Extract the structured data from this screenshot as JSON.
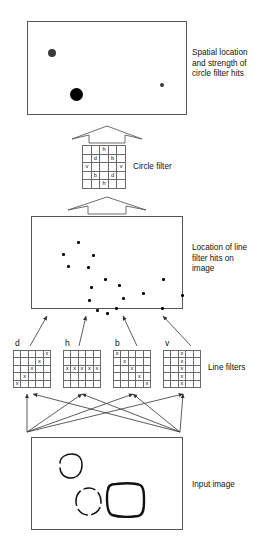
{
  "figure": {
    "stroke_color": "#555555",
    "accent_color": "#000000"
  },
  "panels": {
    "circle_hits": {
      "caption": "Spatial location\nand strength of\ncircle filter hits",
      "dots": [
        {
          "name": "medium-hit-dot",
          "x": 24,
          "y": 31,
          "r": 4.0,
          "shade": "#3a3a3a"
        },
        {
          "name": "strong-hit-dot",
          "x": 48,
          "y": 72,
          "r": 6.5,
          "shade": "#000000"
        },
        {
          "name": "weak-hit-dot",
          "x": 134,
          "y": 63,
          "r": 2.0,
          "shade": "#3a3a3a"
        }
      ]
    },
    "line_hits": {
      "caption": "Location of line\nfilter hits on\nimage",
      "clusters": [
        {
          "name": "cluster-small-circle",
          "dots": [
            {
              "x": 23,
              "y": 6
            },
            {
              "x": 8,
              "y": 18
            },
            {
              "x": 38,
              "y": 19
            },
            {
              "x": 13,
              "y": 30
            },
            {
              "x": 33,
              "y": 31
            }
          ]
        },
        {
          "name": "cluster-dashed-circle",
          "dots": [
            {
              "x": 22,
              "y": 3
            },
            {
              "x": 36,
              "y": 9
            },
            {
              "x": 8,
              "y": 11
            },
            {
              "x": 40,
              "y": 22
            },
            {
              "x": 6,
              "y": 24
            },
            {
              "x": 33,
              "y": 32
            },
            {
              "x": 14,
              "y": 34
            },
            {
              "x": 24,
              "y": 37
            }
          ]
        },
        {
          "name": "cluster-square",
          "dots": [
            {
              "x": 25,
              "y": 4
            },
            {
              "x": 5,
              "y": 18
            },
            {
              "x": 44,
              "y": 20
            },
            {
              "x": 24,
              "y": 33
            }
          ]
        }
      ]
    },
    "input_image": {
      "caption": "Input image",
      "shapes": [
        {
          "name": "small-circle-shape",
          "kind": "circle-solid"
        },
        {
          "name": "dashed-circle-shape",
          "kind": "circle-dashed"
        },
        {
          "name": "rounded-square-shape",
          "kind": "rounded-square"
        }
      ]
    }
  },
  "circle_filter": {
    "label": "Circle filter",
    "rows": 5,
    "cols": 5,
    "cells": [
      [
        "",
        "",
        "h",
        "",
        ""
      ],
      [
        "",
        "d",
        "",
        "b",
        ""
      ],
      [
        "v",
        "",
        "",
        "",
        "v"
      ],
      [
        "",
        "b",
        "",
        "d",
        ""
      ],
      [
        "",
        "",
        "h",
        "",
        ""
      ]
    ]
  },
  "line_filters": {
    "label": "Line filters",
    "mark": "x",
    "filters": [
      {
        "name": "d",
        "label": "d",
        "cells": [
          [
            "",
            "",
            "",
            "",
            "x"
          ],
          [
            "",
            "",
            "",
            "x",
            ""
          ],
          [
            "",
            "",
            "x",
            "",
            ""
          ],
          [
            "",
            "x",
            "",
            "",
            ""
          ],
          [
            "x",
            "",
            "",
            "",
            ""
          ]
        ]
      },
      {
        "name": "h",
        "label": "h",
        "cells": [
          [
            "",
            "",
            "",
            "",
            ""
          ],
          [
            "",
            "",
            "",
            "",
            ""
          ],
          [
            "x",
            "x",
            "x",
            "x",
            "x"
          ],
          [
            "",
            "",
            "",
            "",
            ""
          ],
          [
            "",
            "",
            "",
            "",
            ""
          ]
        ]
      },
      {
        "name": "b",
        "label": "b",
        "cells": [
          [
            "x",
            "",
            "",
            "",
            ""
          ],
          [
            "",
            "x",
            "",
            "",
            ""
          ],
          [
            "",
            "",
            "x",
            "",
            ""
          ],
          [
            "",
            "",
            "",
            "x",
            ""
          ],
          [
            "",
            "",
            "",
            "",
            "x"
          ]
        ]
      },
      {
        "name": "v",
        "label": "v",
        "cells": [
          [
            "",
            "",
            "x",
            "",
            ""
          ],
          [
            "",
            "",
            "x",
            "",
            ""
          ],
          [
            "",
            "",
            "x",
            "",
            ""
          ],
          [
            "",
            "",
            "x",
            "",
            ""
          ],
          [
            "",
            "",
            "x",
            "",
            ""
          ]
        ]
      }
    ]
  }
}
